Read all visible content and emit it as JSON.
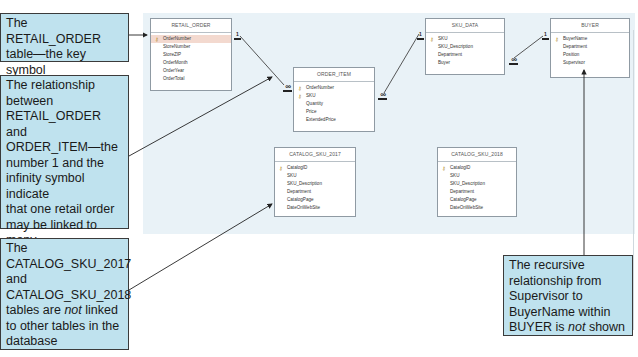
{
  "colors": {
    "canvas_bg": "#e9f2f7",
    "callout_bg": "#bfe2ee",
    "callout_border": "#3b3b3b",
    "selected_row": "#f3d9cf",
    "key_icon": "#b48a2a"
  },
  "icons": {
    "primary_key": "key-icon",
    "one": "1",
    "many": "∞"
  },
  "tables": {
    "retail_order": {
      "title": "RETAIL_ORDER",
      "fields": [
        "OrderNumber",
        "StoreNumber",
        "StoreZIP",
        "OrderMonth",
        "OrderYear",
        "OrderTotal"
      ],
      "primary_keys": [
        "OrderNumber"
      ]
    },
    "order_item": {
      "title": "ORDER_ITEM",
      "fields": [
        "OrderNumber",
        "SKU",
        "Quantity",
        "Price",
        "ExtendedPrice"
      ],
      "primary_keys": [
        "OrderNumber",
        "SKU"
      ]
    },
    "sku_data": {
      "title": "SKU_DATA",
      "fields": [
        "SKU",
        "SKU_Description",
        "Department",
        "Buyer"
      ],
      "primary_keys": [
        "SKU"
      ]
    },
    "buyer": {
      "title": "BUYER",
      "fields": [
        "BuyerName",
        "Department",
        "Position",
        "Supervisor"
      ],
      "primary_keys": [
        "BuyerName"
      ]
    },
    "catalog_sku_2017": {
      "title": "CATALOG_SKU_2017",
      "fields": [
        "CatalogID",
        "SKU",
        "SKU_Description",
        "Department",
        "CatalogPage",
        "DateOnWebSite"
      ],
      "primary_keys": [
        "CatalogID"
      ]
    },
    "catalog_sku_2018": {
      "title": "CATALOG_SKU_2018",
      "fields": [
        "CatalogID",
        "SKU",
        "SKU_Description",
        "Department",
        "CatalogPage",
        "DateOnWebSite"
      ],
      "primary_keys": [
        "CatalogID"
      ]
    }
  },
  "relationships": [
    {
      "from": "RETAIL_ORDER.OrderNumber",
      "to": "ORDER_ITEM.OrderNumber",
      "from_card": "1",
      "to_card": "∞"
    },
    {
      "from": "SKU_DATA.SKU",
      "to": "ORDER_ITEM.SKU",
      "from_card": "1",
      "to_card": "∞"
    },
    {
      "from": "BUYER.BuyerName",
      "to": "SKU_DATA.Buyer",
      "from_card": "1",
      "to_card": "∞"
    }
  ],
  "callouts": {
    "primary_key": {
      "lines": [
        "The RETAIL_ORDER",
        "table—the key symbol",
        "shows the primary key"
      ]
    },
    "relationship": {
      "lines": [
        "The relationship",
        "between",
        "RETAIL_ORDER and",
        "ORDER_ITEM—the",
        "number 1 and the",
        "infinity symbol indicate",
        "that one retail order",
        "may be linked to many",
        "order items by",
        "OrderNumber"
      ]
    },
    "catalog": {
      "line1": "The",
      "line2": "CATALOG_SKU_2017",
      "line3": "and",
      "line4": "CATALOG_SKU_2018",
      "line5_pre": "tables are ",
      "line5_em": "not",
      "line5_post": " linked",
      "line6": "to other tables in the",
      "line7": "database"
    },
    "recursive": {
      "line1": "The recursive",
      "line2": "relationship from",
      "line3": "Supervisor to",
      "line4_pre": "BuyerName within",
      "line5_pre": "BUYER is ",
      "line5_em": "not",
      "line5_post": " shown"
    }
  }
}
